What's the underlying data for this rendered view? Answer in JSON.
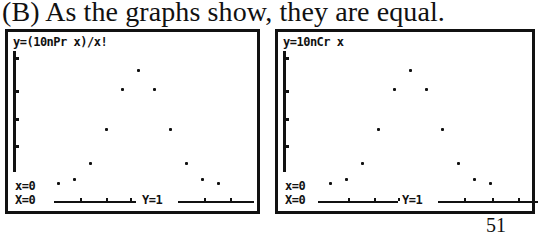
{
  "caption": "(B) As the graphs show, they are equal.",
  "page_number": "51",
  "panels": [
    {
      "equation": "y=(10nPr x)/x!",
      "n_readout": "x=0",
      "x_readout": "X=0",
      "y_readout": "Y=1"
    },
    {
      "equation": "y=10nCr x",
      "n_readout": "x=0",
      "x_readout": "X=0",
      "y_readout": "Y=1"
    }
  ],
  "chart_data": [
    {
      "type": "scatter",
      "title": "y=(10nPr x)/x!",
      "x": [
        0,
        1,
        2,
        3,
        4,
        5,
        6,
        7,
        8,
        9,
        10
      ],
      "y": [
        1,
        10,
        45,
        120,
        210,
        252,
        210,
        120,
        45,
        10,
        1
      ],
      "trace_cursor": {
        "x": 0,
        "y": 1
      },
      "xlim": [
        -0.5,
        10.5
      ],
      "ylim": [
        -30,
        270
      ]
    },
    {
      "type": "scatter",
      "title": "y=10nCr x",
      "x": [
        0,
        1,
        2,
        3,
        4,
        5,
        6,
        7,
        8,
        9,
        10
      ],
      "y": [
        1,
        10,
        45,
        120,
        210,
        252,
        210,
        120,
        45,
        10,
        1
      ],
      "trace_cursor": {
        "x": 0,
        "y": 1
      },
      "xlim": [
        -0.5,
        10.5
      ],
      "ylim": [
        -30,
        270
      ]
    }
  ]
}
